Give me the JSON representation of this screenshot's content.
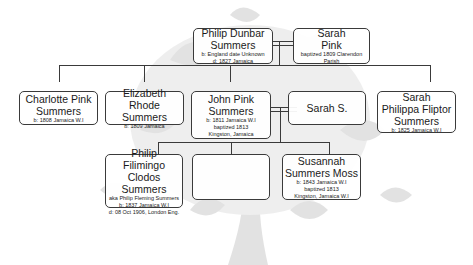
{
  "diagram": {
    "type": "family-tree",
    "generations": [
      {
        "level": 1,
        "people": [
          {
            "id": "philip_dunbar",
            "name_lines": [
              "Philip Dunbar",
              "Summers"
            ],
            "details": [
              "b: England date Unknown",
              "d: 1827 Jamaica"
            ]
          },
          {
            "id": "sarah_pink",
            "name_lines": [
              "Sarah",
              "Pink"
            ],
            "details": [
              "baptized 1809 Clarendon Parish"
            ]
          }
        ]
      },
      {
        "level": 2,
        "people": [
          {
            "id": "charlotte",
            "name_lines": [
              "Charlotte Pink",
              "Summers"
            ],
            "details": [
              "b: 1808 Jamaica W.I"
            ]
          },
          {
            "id": "elizabeth",
            "name_lines": [
              "Elizabeth Rhode",
              "Summers"
            ],
            "details": [
              "b: 1809 Jamaica"
            ]
          },
          {
            "id": "john_pink",
            "name_lines": [
              "John Pink",
              "Summers"
            ],
            "details": [
              "b: 1811 Jamaica W.I",
              "baptized 1813",
              "Kingston, Jamaica"
            ]
          },
          {
            "id": "sarah_s",
            "name_lines": [
              "Sarah S."
            ],
            "details": []
          },
          {
            "id": "sarah_philippa",
            "name_lines": [
              "Sarah",
              "Philippa Fliptor",
              "Summers"
            ],
            "details": [
              "b: 1825 Jamaica W.I"
            ]
          }
        ]
      },
      {
        "level": 3,
        "people": [
          {
            "id": "philip_filimingo",
            "name_lines": [
              "Philip",
              "Filimingo Clodos",
              "Summers"
            ],
            "details": [
              "aka Philip Fleming Summers",
              "b: 1837 Jamaica W.I",
              "d: 08 Oct 1906, London Eng."
            ]
          },
          {
            "id": "empty",
            "name_lines": [],
            "details": []
          },
          {
            "id": "susannah",
            "name_lines": [
              "Susannah",
              "Summers Moss"
            ],
            "details": [
              "b: 1843 Jamaica W.I",
              "baptized 1813",
              "Kingston, Jamaica W.I"
            ]
          }
        ]
      }
    ],
    "relationships": [
      {
        "type": "marriage",
        "between": [
          "philip_dunbar",
          "sarah_pink"
        ]
      },
      {
        "type": "marriage",
        "between": [
          "john_pink",
          "sarah_s"
        ]
      },
      {
        "type": "children",
        "parents": [
          "philip_dunbar",
          "sarah_pink"
        ],
        "children": [
          "charlotte",
          "elizabeth",
          "john_pink",
          "sarah_s",
          "sarah_philippa"
        ]
      },
      {
        "type": "children",
        "parents": [
          "john_pink",
          "sarah_s"
        ],
        "children": [
          "philip_filimingo",
          "empty",
          "susannah"
        ]
      }
    ]
  },
  "colors": {
    "line": "#3a3a3a",
    "background_tree": "#d9d9d9"
  }
}
